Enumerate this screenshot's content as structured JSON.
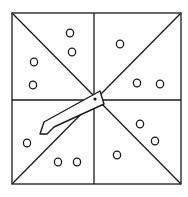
{
  "game": {
    "type": "spinner",
    "description": "Square spinner divided into 8 triangular sections, each marked with dots",
    "colors": {
      "line": "#1a1a1a",
      "background": "#ffffff",
      "arrow_fill": "#ffffff"
    },
    "board": {
      "x1": 12,
      "y1": 13,
      "x2": 181,
      "y2": 184,
      "cx": 94,
      "cy": 100
    },
    "sections": [
      {
        "id": "top-left-upper",
        "dots": 2,
        "positions": [
          [
            70,
            33
          ],
          [
            72,
            52
          ]
        ]
      },
      {
        "id": "top-left-lower",
        "dots": 2,
        "positions": [
          [
            34,
            62
          ],
          [
            33,
            85
          ]
        ]
      },
      {
        "id": "top-right-upper",
        "dots": 1,
        "positions": [
          [
            120,
            44
          ]
        ]
      },
      {
        "id": "top-right-lower",
        "dots": 2,
        "positions": [
          [
            137,
            83
          ],
          [
            160,
            84
          ]
        ]
      },
      {
        "id": "bottom-left-upper",
        "dots": 1,
        "positions": [
          [
            27,
            143
          ]
        ]
      },
      {
        "id": "bottom-left-lower",
        "dots": 2,
        "positions": [
          [
            58,
            162
          ],
          [
            77,
            162
          ]
        ]
      },
      {
        "id": "bottom-right-upper",
        "dots": 2,
        "positions": [
          [
            140,
            124
          ],
          [
            155,
            141
          ]
        ]
      },
      {
        "id": "bottom-right-lower",
        "dots": 1,
        "positions": [
          [
            117,
            155
          ]
        ]
      }
    ],
    "arrow": {
      "pivot": [
        95,
        99
      ],
      "points": "100,91 104,104 54,127 47,134 40,134 44,122",
      "pointing": "lower-left"
    }
  }
}
